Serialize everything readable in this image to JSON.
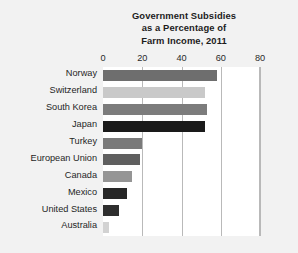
{
  "chart_data": {
    "type": "bar",
    "orientation": "horizontal",
    "title": "Government Subsidies as a Percentage of Farm Income, 2011",
    "title_lines": [
      "Government Subsidies",
      "as a Percentage of",
      "Farm Income, 2011"
    ],
    "xlabel": "",
    "ylabel": "",
    "xlim": [
      0,
      80
    ],
    "xticks": [
      0,
      20,
      40,
      60,
      80
    ],
    "xtick_labels": [
      "0",
      "20",
      "40",
      "60",
      "80"
    ],
    "grid": "vertical",
    "legend": "none",
    "categories": [
      "Norway",
      "Switzerland",
      "South Korea",
      "Japan",
      "Turkey",
      "European Union",
      "Canada",
      "Mexico",
      "United States",
      "Australia"
    ],
    "values": [
      58,
      52,
      53,
      52,
      20,
      19,
      15,
      12,
      8,
      3
    ],
    "bars": [
      {
        "label": "Norway",
        "value": 58,
        "color": "#6e6e6e"
      },
      {
        "label": "Switzerland",
        "value": 52,
        "color": "#c9c9c9"
      },
      {
        "label": "South Korea",
        "value": 53,
        "color": "#7c7c7c"
      },
      {
        "label": "Japan",
        "value": 52,
        "color": "#1a1a1a"
      },
      {
        "label": "Turkey",
        "value": 20,
        "color": "#7a7a7a"
      },
      {
        "label": "European Union",
        "value": 19,
        "color": "#5f5f5f"
      },
      {
        "label": "Canada",
        "value": 15,
        "color": "#959595"
      },
      {
        "label": "Mexico",
        "value": 12,
        "color": "#272727"
      },
      {
        "label": "United States",
        "value": 8,
        "color": "#2e2e2e"
      },
      {
        "label": "Australia",
        "value": 3,
        "color": "#d2d2d2"
      }
    ]
  },
  "colors": {
    "page_background": "#f2f2f2",
    "plot_background": "#ffffff",
    "gridline": "#b9b9b9",
    "text": "#1f1f1f",
    "title_text": "#1c1c1c"
  }
}
